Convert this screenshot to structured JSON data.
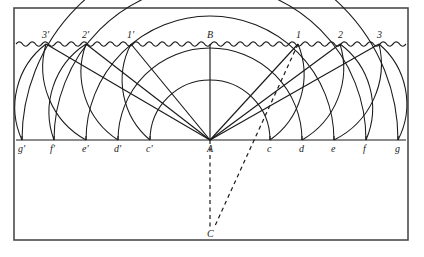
{
  "figure": {
    "colors": {
      "ink": "#1a1a1a",
      "frame": "#4a4a50",
      "background": "#ffffff"
    },
    "frame": {
      "x": 14,
      "y": 8,
      "width": 394,
      "height": 232
    },
    "surface": {
      "name": "wavy-water-surface",
      "y": 44,
      "x_start": 16,
      "x_end": 406,
      "wave_amplitude": 2.2,
      "wave_period": 13
    },
    "baseline": {
      "y": 140,
      "x_start": 16,
      "x_end": 406
    },
    "center_point": {
      "label": "A",
      "x": 210,
      "y": 140
    },
    "apex_point": {
      "label": "B",
      "x": 210,
      "y": 44
    },
    "focus_point": {
      "label": "C",
      "x": 210,
      "y": 230
    },
    "baseline_points_left": [
      {
        "label": "g'",
        "x": 22
      },
      {
        "label": "f'",
        "x": 54
      },
      {
        "label": "e'",
        "x": 86
      },
      {
        "label": "d'",
        "x": 118
      },
      {
        "label": "c'",
        "x": 150
      }
    ],
    "baseline_points_right": [
      {
        "label": "c",
        "x": 270
      },
      {
        "label": "d",
        "x": 302
      },
      {
        "label": "e",
        "x": 334
      },
      {
        "label": "f",
        "x": 366
      },
      {
        "label": "g",
        "x": 398
      }
    ],
    "surface_points_left": [
      {
        "label": "1'",
        "x": 131
      },
      {
        "label": "2'",
        "x": 86
      },
      {
        "label": "3'",
        "x": 46
      }
    ],
    "surface_points_right": [
      {
        "label": "1",
        "x": 298
      },
      {
        "label": "2",
        "x": 340
      },
      {
        "label": "3",
        "x": 379
      }
    ],
    "arc_radii": [
      60,
      92,
      124,
      156,
      188
    ],
    "rays_from_center": [
      {
        "to": "1'",
        "x": 131,
        "y": 44
      },
      {
        "to": "2'",
        "x": 86,
        "y": 44
      },
      {
        "to": "3'",
        "x": 46,
        "y": 44
      },
      {
        "to": "1",
        "x": 298,
        "y": 44
      },
      {
        "to": "2",
        "x": 340,
        "y": 44
      },
      {
        "to": "3",
        "x": 379,
        "y": 44
      },
      {
        "to": "B",
        "x": 210,
        "y": 44
      }
    ],
    "dashed_lines": [
      {
        "name": "vertical-axis-to-C",
        "x1": 210,
        "y1": 140,
        "x2": 210,
        "y2": 228
      },
      {
        "name": "refracted-ray-1-to-C",
        "x1": 298,
        "y1": 44,
        "x2": 214,
        "y2": 228
      }
    ],
    "wavefront_arcs_left": [
      {
        "from": "1'",
        "to": "c'"
      },
      {
        "from": "2'",
        "to": "d'"
      },
      {
        "from": "3'",
        "to": "e'"
      }
    ],
    "wavefront_arcs_right": [
      {
        "from": "1",
        "to": "c"
      },
      {
        "from": "2",
        "to": "d"
      },
      {
        "from": "3",
        "to": "e"
      }
    ]
  }
}
